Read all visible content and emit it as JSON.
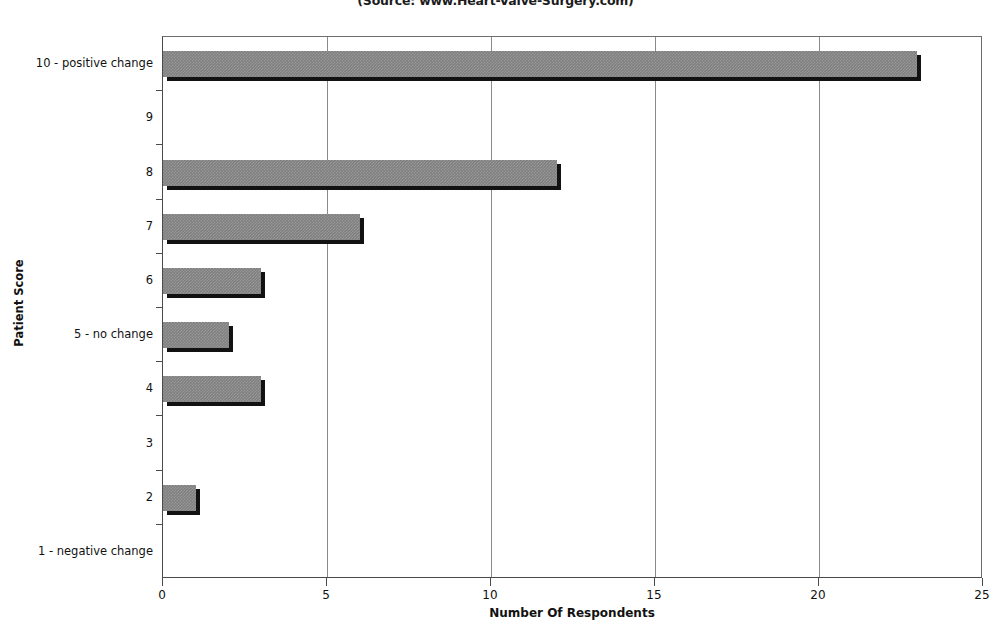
{
  "chart_data": {
    "type": "bar",
    "orientation": "horizontal",
    "title": "",
    "subtitle": "(Source: www.Heart-Valve-Surgery.com)",
    "xlabel": "Number Of Respondents",
    "ylabel": "Patient Score",
    "categories": [
      "10 - positive change",
      "9",
      "8",
      "7",
      "6",
      "5 - no change",
      "4",
      "3",
      "2",
      "1 - negative change"
    ],
    "values": [
      23,
      0,
      12,
      6,
      3,
      2,
      3,
      0,
      1,
      0
    ],
    "xlim": [
      0,
      25
    ],
    "xticks": [
      "0",
      "5",
      "10",
      "15",
      "20",
      "25"
    ],
    "xtick_values": [
      0,
      5,
      10,
      15,
      20,
      25
    ],
    "grid": "vertical",
    "legend": "none",
    "bar_color": "#808080",
    "bar_shadow_color": "#121212",
    "axis_color": "#4a4a4a",
    "gridline_color": "#8a8a8a",
    "background": "#ffffff"
  }
}
